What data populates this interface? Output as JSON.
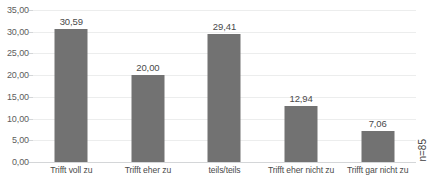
{
  "chart_data": {
    "type": "bar",
    "title": "",
    "xlabel": "",
    "ylabel": "",
    "categories": [
      "Trifft voll zu",
      "Trifft eher zu",
      "teils/teils",
      "Trifft eher nicht zu",
      "Trifft gar nicht zu"
    ],
    "values": [
      30.59,
      20.0,
      29.41,
      12.94,
      7.06
    ],
    "value_labels": [
      "30,59",
      "20,00",
      "29,41",
      "12,94",
      "7,06"
    ],
    "ylim": [
      0,
      35
    ],
    "ytick_values": [
      0,
      5,
      10,
      15,
      20,
      25,
      30,
      35
    ],
    "ytick_labels": [
      "0,00",
      "5,00",
      "10,00",
      "15,00",
      "20,00",
      "25,00",
      "30,00",
      "35,00"
    ],
    "grid": true,
    "legend": null,
    "annotations": [
      {
        "name": "sample-size",
        "text": "n=85",
        "rotation": 90,
        "position": "right-inside"
      }
    ],
    "colors": {
      "bar": "#727272",
      "gridline": "#eceded",
      "axis": "#d4d6d8",
      "text": "#4a4a4a",
      "tick_text": "#5d5d5d",
      "background": "#ffffff"
    }
  },
  "annotation": {
    "sample_size": "n=85"
  },
  "title_sliver": {
    "text": ""
  }
}
